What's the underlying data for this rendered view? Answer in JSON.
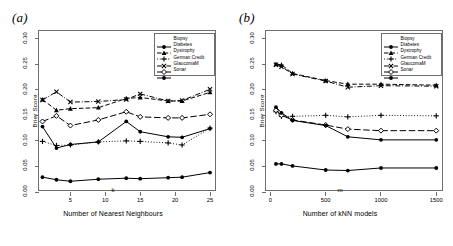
{
  "figure": {
    "panels": [
      {
        "key": "a",
        "label": "(a)",
        "xlabel_symbol": "k",
        "xlabel_caption": "Number of Nearest Neighbours",
        "ylabel": "Brier Score"
      },
      {
        "key": "b",
        "label": "(b)",
        "xlabel_symbol": "m",
        "xlabel_caption": "Number of kNN models",
        "ylabel": "Brier Score"
      }
    ]
  },
  "legend": {
    "entries": [
      {
        "label": "Biopsy",
        "marker": "circle-filled",
        "dash": "solid"
      },
      {
        "label": "Diabetes",
        "marker": "triangle",
        "dash": "dashed"
      },
      {
        "label": "Dystrophy",
        "marker": "plus",
        "dash": "dotted"
      },
      {
        "label": "German Credit",
        "marker": "cross",
        "dash": "dashdot"
      },
      {
        "label": "GlaucomaM",
        "marker": "diamond",
        "dash": "longdash"
      },
      {
        "label": "Sonar",
        "marker": "circle-filled",
        "dash": "solid"
      }
    ]
  },
  "chart_data": [
    {
      "type": "line",
      "panel": "a",
      "title": "(a)",
      "xlabel": "k",
      "xlabel_caption": "Number of Nearest Neighbours",
      "ylabel": "Brier Score",
      "xlim": [
        0.5,
        26
      ],
      "ylim": [
        0.0,
        0.315
      ],
      "xticks": [
        5,
        10,
        15,
        20,
        25
      ],
      "yticks": [
        0.0,
        0.05,
        0.1,
        0.15,
        0.2,
        0.25,
        0.3
      ],
      "ytick_labels": [
        "0.00",
        "0.05",
        "0.10",
        "0.15",
        "0.20",
        "0.25",
        "0.30"
      ],
      "xtick_labels": [
        "5",
        "10",
        "15",
        "20",
        "25"
      ],
      "grid": false,
      "legend_position": "top-right",
      "x": [
        1,
        3,
        5,
        9,
        13,
        15,
        19,
        21,
        25
      ],
      "series": [
        {
          "name": "Biopsy",
          "marker": "circle-filled",
          "dash": "solid",
          "values": [
            0.029,
            0.024,
            0.021,
            0.025,
            0.027,
            0.026,
            0.028,
            0.029,
            0.038
          ]
        },
        {
          "name": "Diabetes",
          "marker": "triangle",
          "dash": "dashed",
          "values": [
            0.181,
            0.16,
            0.163,
            0.165,
            0.183,
            0.185,
            0.178,
            0.178,
            0.195
          ]
        },
        {
          "name": "Dystrophy",
          "marker": "plus",
          "dash": "dotted",
          "values": [
            0.099,
            0.091,
            0.092,
            0.098,
            0.1,
            0.099,
            0.096,
            0.092,
            0.125
          ]
        },
        {
          "name": "German Credit",
          "marker": "cross",
          "dash": "dashdot",
          "values": [
            0.18,
            0.196,
            0.176,
            0.177,
            0.181,
            0.192,
            0.178,
            0.179,
            0.201
          ]
        },
        {
          "name": "GlaucomaM",
          "marker": "diamond",
          "dash": "longdash",
          "values": [
            0.138,
            0.149,
            0.13,
            0.141,
            0.157,
            0.147,
            0.145,
            0.145,
            0.152
          ]
        },
        {
          "name": "Sonar",
          "marker": "circle-filled",
          "dash": "solid",
          "values": [
            0.128,
            0.086,
            0.093,
            0.098,
            0.138,
            0.118,
            0.108,
            0.107,
            0.124
          ]
        }
      ]
    },
    {
      "type": "line",
      "panel": "b",
      "title": "(b)",
      "xlabel": "m",
      "xlabel_caption": "Number of kNN models",
      "ylabel": "Brier Score",
      "xlim": [
        -40,
        1570
      ],
      "ylim": [
        0.0,
        0.315
      ],
      "xticks": [
        0,
        500,
        1000,
        1500
      ],
      "yticks": [
        0.0,
        0.05,
        0.1,
        0.15,
        0.2,
        0.25,
        0.3
      ],
      "ytick_labels": [
        "0.00",
        "0.05",
        "0.10",
        "0.15",
        "0.20",
        "0.25",
        "0.30"
      ],
      "xtick_labels": [
        "0",
        "500",
        "1000",
        "1500"
      ],
      "grid": false,
      "legend_position": "top-right",
      "x": [
        50,
        100,
        200,
        500,
        700,
        1000,
        1500
      ],
      "series": [
        {
          "name": "Biopsy",
          "marker": "circle-filled",
          "dash": "solid",
          "values": [
            0.055,
            0.055,
            0.051,
            0.043,
            0.042,
            0.047,
            0.047
          ]
        },
        {
          "name": "Diabetes",
          "marker": "triangle",
          "dash": "dashed",
          "values": [
            0.25,
            0.249,
            0.232,
            0.218,
            0.211,
            0.211,
            0.209
          ]
        },
        {
          "name": "Dystrophy",
          "marker": "plus",
          "dash": "dotted",
          "values": [
            0.157,
            0.148,
            0.148,
            0.15,
            0.147,
            0.15,
            0.149
          ]
        },
        {
          "name": "German Credit",
          "marker": "cross",
          "dash": "dashdot",
          "values": [
            0.249,
            0.245,
            0.231,
            0.217,
            0.205,
            0.208,
            0.207
          ]
        },
        {
          "name": "GlaucomaM",
          "marker": "diamond",
          "dash": "longdash",
          "values": [
            0.16,
            0.15,
            0.141,
            0.131,
            0.123,
            0.12,
            0.12
          ]
        },
        {
          "name": "Sonar",
          "marker": "circle-filled",
          "dash": "solid",
          "values": [
            0.166,
            0.155,
            0.14,
            0.13,
            0.108,
            0.102,
            0.102
          ]
        }
      ]
    }
  ]
}
